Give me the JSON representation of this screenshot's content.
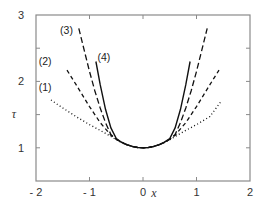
{
  "chart_data": {
    "type": "line",
    "title": "",
    "xlabel": "x",
    "ylabel": "τ",
    "xlim": [
      -2,
      2
    ],
    "ylim": [
      0.5,
      3
    ],
    "grid": false,
    "legend": "inline labels",
    "x_ticks": [
      -2,
      -1,
      0,
      1,
      2
    ],
    "x_tick_labels": [
      "- 2",
      "- 1",
      "0",
      "1",
      "2"
    ],
    "y_ticks": [
      1,
      2,
      3
    ],
    "y_tick_labels": [
      "1",
      "2",
      "3"
    ],
    "y_minor_ticks": [
      1.5,
      2.5
    ],
    "x_minor_ticks": [],
    "series": [
      {
        "name": "(1)",
        "style": "dotted",
        "label_pos": [
          -1.95,
          1.85
        ],
        "x": [
          -1.72,
          -1.5,
          -1.25,
          -1.0,
          -0.75,
          -0.6,
          -0.5,
          -0.4,
          -0.3,
          -0.2,
          -0.1,
          0,
          0.1,
          0.2,
          0.3,
          0.4,
          0.5,
          0.6,
          0.75,
          1.0,
          1.25,
          1.45
        ],
        "y": [
          1.72,
          1.6,
          1.47,
          1.35,
          1.24,
          1.17,
          1.12,
          1.08,
          1.045,
          1.02,
          1.005,
          1.0,
          1.005,
          1.02,
          1.045,
          1.08,
          1.12,
          1.17,
          1.24,
          1.35,
          1.47,
          1.69
        ]
      },
      {
        "name": "(2)",
        "style": "dashed",
        "label_pos": [
          -1.95,
          2.25
        ],
        "x": [
          -1.42,
          -1.25,
          -1.0,
          -0.8,
          -0.6,
          -0.5,
          -0.4,
          -0.3,
          -0.2,
          -0.1,
          0,
          0.1,
          0.2,
          0.3,
          0.4,
          0.5,
          0.6,
          0.8,
          1.0,
          1.25,
          1.42
        ],
        "y": [
          2.17,
          1.95,
          1.62,
          1.38,
          1.19,
          1.13,
          1.08,
          1.045,
          1.02,
          1.005,
          1.0,
          1.005,
          1.02,
          1.045,
          1.08,
          1.13,
          1.19,
          1.38,
          1.62,
          1.95,
          2.17
        ]
      },
      {
        "name": "(3)",
        "style": "long-dashed",
        "label_pos": [
          -1.55,
          2.72
        ],
        "x": [
          -1.2,
          -1.1,
          -1.0,
          -0.9,
          -0.8,
          -0.7,
          -0.6,
          -0.5,
          -0.4,
          -0.3,
          -0.2,
          -0.1,
          0,
          0.1,
          0.2,
          0.3,
          0.4,
          0.5,
          0.6,
          0.7,
          0.8,
          0.9,
          1.0,
          1.1,
          1.2
        ],
        "y": [
          2.8,
          2.47,
          2.15,
          1.86,
          1.6,
          1.38,
          1.2,
          1.13,
          1.08,
          1.045,
          1.02,
          1.005,
          1.0,
          1.005,
          1.02,
          1.045,
          1.08,
          1.13,
          1.2,
          1.38,
          1.6,
          1.86,
          2.15,
          2.47,
          2.8
        ]
      },
      {
        "name": "(4)",
        "style": "solid",
        "label_pos": [
          -0.85,
          2.3
        ],
        "x": [
          -0.88,
          -0.8,
          -0.7,
          -0.6,
          -0.5,
          -0.4,
          -0.3,
          -0.2,
          -0.1,
          0,
          0.1,
          0.2,
          0.3,
          0.4,
          0.5,
          0.6,
          0.7,
          0.8,
          0.88
        ],
        "y": [
          2.3,
          1.95,
          1.58,
          1.3,
          1.14,
          1.085,
          1.048,
          1.021,
          1.005,
          1.0,
          1.005,
          1.021,
          1.048,
          1.085,
          1.14,
          1.3,
          1.58,
          1.95,
          2.3
        ]
      }
    ]
  }
}
